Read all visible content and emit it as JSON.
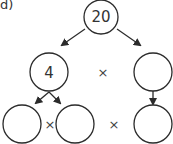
{
  "question_label": "d)",
  "colors": {
    "stroke": "#2b2b2b",
    "text": "#333333",
    "background": "#ffffff"
  },
  "tree": {
    "root": {
      "value": "20",
      "cx": 101,
      "cy": 17,
      "r": 17
    },
    "level1": [
      {
        "value": "4",
        "cx": 49,
        "cy": 72,
        "r": 19
      },
      {
        "value": "",
        "cx": 153,
        "cy": 72,
        "r": 19
      }
    ],
    "level2": [
      {
        "value": "",
        "cx": 22,
        "cy": 124,
        "r": 19
      },
      {
        "value": "",
        "cx": 75,
        "cy": 124,
        "r": 19
      },
      {
        "value": "",
        "cx": 153,
        "cy": 124,
        "r": 19
      }
    ],
    "operators": [
      {
        "symbol": "×",
        "x": 103,
        "y": 77
      },
      {
        "symbol": "×",
        "x": 50,
        "y": 129
      },
      {
        "symbol": "×",
        "x": 114,
        "y": 129
      }
    ]
  }
}
